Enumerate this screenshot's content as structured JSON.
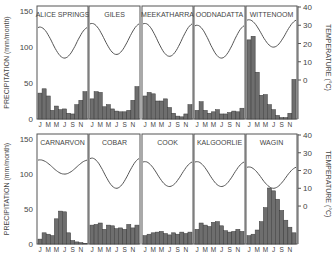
{
  "chart_data": {
    "type": "bar",
    "months": [
      "J",
      "F",
      "M",
      "A",
      "M",
      "J",
      "J",
      "A",
      "S",
      "O",
      "N",
      "D"
    ],
    "month_tick_labels": [
      "J",
      "M",
      "M",
      "J",
      "S",
      "N"
    ],
    "left_axis": {
      "label": "PRECIPITATION (mm/month)",
      "ticks": [
        0,
        50,
        100,
        150
      ],
      "range": [
        0,
        150
      ]
    },
    "right_axis": {
      "label": "TEMPERATURE (°C)",
      "ticks": [
        0,
        10,
        20,
        30,
        40
      ],
      "range": [
        -40,
        40
      ]
    },
    "panels": [
      {
        "name": "ALICE SPRINGS",
        "row": 0,
        "col": 0,
        "precipitation": [
          36,
          42,
          32,
          12,
          18,
          13,
          14,
          8,
          7,
          20,
          26,
          38
        ],
        "temp_max": 29,
        "temp_min": 12
      },
      {
        "name": "GILES",
        "row": 0,
        "col": 1,
        "precipitation": [
          28,
          38,
          37,
          17,
          20,
          14,
          11,
          10,
          10,
          12,
          26,
          45
        ],
        "temp_max": 31,
        "temp_min": 14
      },
      {
        "name": "MEEKATHARRA",
        "row": 0,
        "col": 2,
        "precipitation": [
          32,
          37,
          35,
          25,
          25,
          28,
          16,
          8,
          4,
          3,
          7,
          20
        ],
        "temp_max": 31,
        "temp_min": 13
      },
      {
        "name": "OODNADATTA",
        "row": 0,
        "col": 3,
        "precipitation": [
          12,
          24,
          12,
          8,
          10,
          13,
          7,
          7,
          9,
          11,
          10,
          15
        ],
        "temp_max": 30,
        "temp_min": 12
      },
      {
        "name": "WITTENOOM",
        "row": 0,
        "col": 4,
        "precipitation": [
          110,
          115,
          65,
          33,
          34,
          20,
          13,
          5,
          2,
          2,
          8,
          55
        ],
        "temp_max": 33,
        "temp_min": 18
      },
      {
        "name": "CARNARVON",
        "row": 1,
        "col": 0,
        "precipitation": [
          7,
          16,
          14,
          12,
          36,
          47,
          46,
          16,
          5,
          3,
          2,
          1
        ],
        "temp_max": 26,
        "temp_min": 18
      },
      {
        "name": "COBAR",
        "row": 1,
        "col": 1,
        "precipitation": [
          27,
          28,
          30,
          21,
          27,
          26,
          22,
          23,
          21,
          28,
          23,
          27
        ],
        "temp_max": 27,
        "temp_min": 10
      },
      {
        "name": "COOK",
        "row": 1,
        "col": 2,
        "precipitation": [
          12,
          14,
          16,
          17,
          18,
          15,
          13,
          16,
          14,
          17,
          15,
          17
        ],
        "temp_max": 25,
        "temp_min": 11
      },
      {
        "name": "KALGOORLIE",
        "row": 1,
        "col": 3,
        "precipitation": [
          21,
          30,
          27,
          25,
          31,
          32,
          26,
          19,
          17,
          18,
          21,
          18
        ],
        "temp_max": 25,
        "temp_min": 11
      },
      {
        "name": "WAGIN",
        "row": 1,
        "col": 4,
        "precipitation": [
          12,
          14,
          20,
          32,
          52,
          80,
          76,
          64,
          48,
          34,
          24,
          16
        ],
        "temp_max": 22,
        "temp_min": 10
      }
    ],
    "colors": {
      "bar_fill": "#6e6e6e",
      "bar_stroke": "#3a3a3a",
      "frame": "#555555",
      "curve": "#555555"
    }
  }
}
